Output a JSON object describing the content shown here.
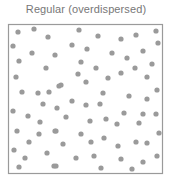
{
  "title": "Regular (overdispersed)",
  "colors": {
    "dot": "#9a9a9a",
    "border": "#9a9a9a",
    "title": "#777777"
  },
  "box": {
    "x": 8,
    "y": 24,
    "width": 154,
    "height": 149
  },
  "dot_radius": 2.6,
  "points": [
    [
      18,
      32
    ],
    [
      34,
      29
    ],
    [
      48,
      37
    ],
    [
      13,
      46
    ],
    [
      32,
      53
    ],
    [
      55,
      55
    ],
    [
      19,
      61
    ],
    [
      46,
      68
    ],
    [
      79,
      30
    ],
    [
      98,
      36
    ],
    [
      72,
      45
    ],
    [
      87,
      49
    ],
    [
      112,
      53
    ],
    [
      81,
      62
    ],
    [
      96,
      68
    ],
    [
      78,
      74
    ],
    [
      121,
      39
    ],
    [
      136,
      35
    ],
    [
      156,
      31
    ],
    [
      158,
      43
    ],
    [
      143,
      51
    ],
    [
      127,
      58
    ],
    [
      152,
      64
    ],
    [
      135,
      68
    ],
    [
      121,
      73
    ],
    [
      16,
      77
    ],
    [
      22,
      92
    ],
    [
      38,
      93
    ],
    [
      49,
      92
    ],
    [
      59,
      86
    ],
    [
      43,
      104
    ],
    [
      13,
      111
    ],
    [
      57,
      108
    ],
    [
      28,
      116
    ],
    [
      40,
      122
    ],
    [
      108,
      78
    ],
    [
      61,
      85
    ],
    [
      86,
      82
    ],
    [
      103,
      93
    ],
    [
      72,
      101
    ],
    [
      86,
      105
    ],
    [
      100,
      104
    ],
    [
      66,
      117
    ],
    [
      90,
      121
    ],
    [
      106,
      119
    ],
    [
      147,
      77
    ],
    [
      157,
      90
    ],
    [
      129,
      96
    ],
    [
      147,
      99
    ],
    [
      124,
      113
    ],
    [
      143,
      114
    ],
    [
      156,
      114
    ],
    [
      117,
      124
    ],
    [
      139,
      123
    ],
    [
      17,
      131
    ],
    [
      39,
      134
    ],
    [
      55,
      131
    ],
    [
      29,
      142
    ],
    [
      14,
      150
    ],
    [
      47,
      153
    ],
    [
      25,
      158
    ],
    [
      19,
      167
    ],
    [
      54,
      166
    ],
    [
      56,
      131
    ],
    [
      81,
      134
    ],
    [
      63,
      144
    ],
    [
      91,
      142
    ],
    [
      104,
      138
    ],
    [
      76,
      158
    ],
    [
      94,
      156
    ],
    [
      56,
      166
    ],
    [
      101,
      168
    ],
    [
      159,
      133
    ],
    [
      118,
      146
    ],
    [
      136,
      142
    ],
    [
      147,
      143
    ],
    [
      157,
      156
    ],
    [
      121,
      159
    ],
    [
      143,
      162
    ],
    [
      132,
      169
    ]
  ]
}
